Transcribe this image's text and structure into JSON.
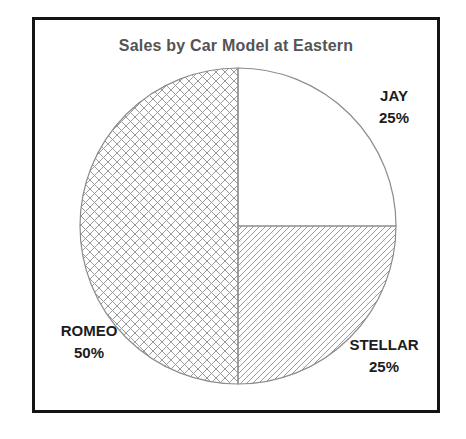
{
  "chart_data": {
    "type": "pie",
    "title": "Sales by Car Model at Eastern",
    "slices": [
      {
        "label": "JAY",
        "value": 25,
        "pct_label": "25%",
        "fill_pattern": "solid-white"
      },
      {
        "label": "STELLAR",
        "value": 25,
        "pct_label": "25%",
        "fill_pattern": "diagonal-hatch"
      },
      {
        "label": "ROMEO",
        "value": 50,
        "pct_label": "50%",
        "fill_pattern": "crosshatch"
      }
    ],
    "start_angle_deg": -90,
    "direction": "clockwise",
    "legend_position": "labels-around-pie",
    "colors": {
      "outline": "#8c8c8c",
      "hatch": "#9a9a9a",
      "title_text": "#545454",
      "label_text": "#1c1c1c",
      "frame_border": "#141414",
      "background": "#ffffff"
    }
  }
}
